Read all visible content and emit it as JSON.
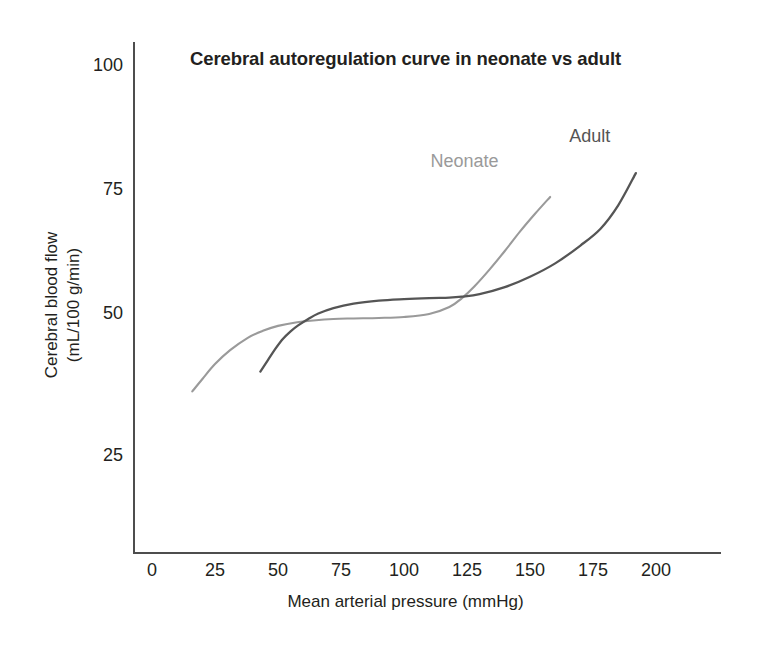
{
  "chart_data": {
    "type": "line",
    "title": "Cerebral autoregulation curve in neonate vs adult",
    "xlabel": "Mean arterial pressure (mmHg)",
    "ylabel": "Cerebral blood flow\n(mL/100 g/min)",
    "ylabel_line1": "Cerebral blood flow",
    "ylabel_line2": "(mL/100 g/min)",
    "xlim": [
      0,
      225
    ],
    "ylim": [
      0,
      103
    ],
    "xticks": [
      0,
      25,
      50,
      75,
      100,
      125,
      150,
      175,
      200
    ],
    "yticks": [
      25,
      50,
      75,
      100
    ],
    "grid": false,
    "legend_position": "inline-annotations",
    "series": [
      {
        "name": "Neonate",
        "color": "#9a9a9a",
        "label_x": 128,
        "label_y": 80,
        "x": [
          16,
          20,
          25,
          31,
          38,
          44,
          50,
          57,
          64,
          72,
          80,
          90,
          100,
          110,
          118,
          123,
          128,
          134,
          140,
          146,
          152,
          158
        ],
        "y": [
          34,
          36.5,
          39.5,
          42.3,
          44.8,
          46.2,
          47.2,
          47.9,
          48.3,
          48.6,
          48.7,
          48.8,
          49.0,
          49.6,
          51.0,
          52.8,
          55.2,
          58.6,
          62.3,
          66.2,
          69.8,
          73.2
        ]
      },
      {
        "name": "Adult",
        "color": "#555555",
        "label_x": 183,
        "label_y": 85,
        "x": [
          43,
          46,
          49,
          52,
          55,
          58,
          62,
          66,
          72,
          80,
          90,
          100,
          110,
          118,
          123,
          130,
          140,
          150,
          160,
          170,
          178,
          185,
          192
        ],
        "y": [
          38,
          40.3,
          42.6,
          44.6,
          46.1,
          47.3,
          48.6,
          49.7,
          50.8,
          51.7,
          52.3,
          52.6,
          52.8,
          52.9,
          53.1,
          53.6,
          55.0,
          57.1,
          59.8,
          63.4,
          66.8,
          71.5,
          78.0
        ]
      }
    ]
  },
  "axes": {
    "y_tick_labels": [
      "100",
      "75",
      "50",
      "25"
    ],
    "x_tick_labels": [
      "0",
      "25",
      "50",
      "75",
      "100",
      "125",
      "150",
      "175",
      "200"
    ]
  },
  "colors": {
    "neonate": "#9a9a9a",
    "adult": "#555555",
    "axis": "#4d4d4d",
    "text": "#231f20",
    "background": "#ffffff"
  }
}
